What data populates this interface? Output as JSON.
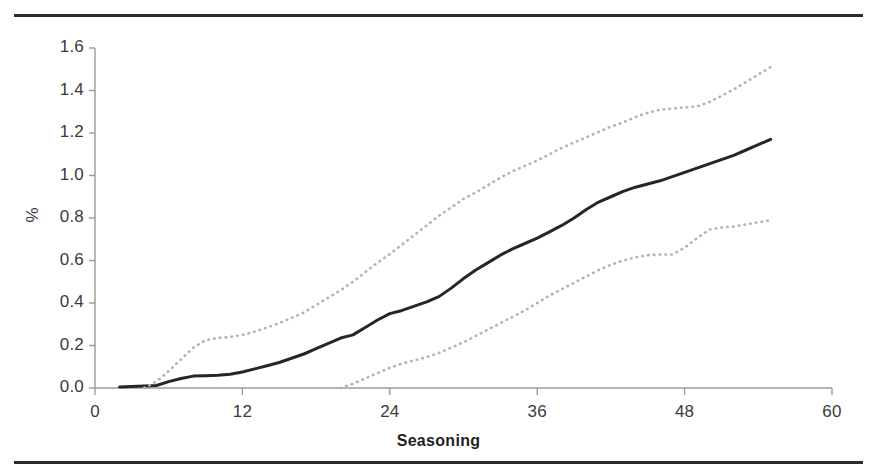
{
  "figure": {
    "background_color": "#ffffff",
    "rule_color": "#2b2b2b",
    "axis_color": "#9a9a9a",
    "solid_series_color": "#262626",
    "dotted_series_color": "#b3b3b3"
  },
  "axes": {
    "y_label": "%",
    "x_label": "Seasoning",
    "y_ticks": [
      "0.0",
      "0.2",
      "0.4",
      "0.6",
      "0.8",
      "1.0",
      "1.2",
      "1.4",
      "1.6"
    ],
    "x_ticks": [
      "0",
      "12",
      "24",
      "36",
      "48",
      "60"
    ]
  },
  "chart_data": {
    "type": "line",
    "title": "",
    "subtitle": "",
    "xlabel": "Seasoning",
    "ylabel": "%",
    "xlim": [
      0,
      60
    ],
    "ylim": [
      0.0,
      1.6
    ],
    "xticks": [
      0,
      12,
      24,
      36,
      48,
      60
    ],
    "yticks": [
      0.0,
      0.2,
      0.4,
      0.6,
      0.8,
      1.0,
      1.2,
      1.4,
      1.6
    ],
    "grid": false,
    "legend": null,
    "legend_position": "none",
    "annotations": [],
    "series": [
      {
        "name": "estimate",
        "style": "solid",
        "color": "#262626",
        "width": 3.0,
        "x": [
          2,
          3,
          4,
          5,
          6,
          7,
          8,
          9,
          10,
          11,
          12,
          13,
          14,
          15,
          16,
          17,
          18,
          19,
          20,
          21,
          22,
          23,
          24,
          25,
          26,
          27,
          28,
          29,
          30,
          31,
          32,
          33,
          34,
          35,
          36,
          37,
          38,
          39,
          40,
          41,
          42,
          43,
          44,
          45,
          46,
          47,
          48,
          49,
          50,
          51,
          52,
          53,
          54,
          55
        ],
        "y": [
          0.005,
          0.007,
          0.01,
          0.012,
          0.03,
          0.045,
          0.056,
          0.058,
          0.06,
          0.065,
          0.075,
          0.09,
          0.105,
          0.12,
          0.14,
          0.16,
          0.185,
          0.21,
          0.235,
          0.25,
          0.285,
          0.32,
          0.35,
          0.365,
          0.385,
          0.405,
          0.43,
          0.47,
          0.515,
          0.555,
          0.59,
          0.625,
          0.655,
          0.68,
          0.705,
          0.735,
          0.765,
          0.8,
          0.84,
          0.875,
          0.9,
          0.925,
          0.945,
          0.96,
          0.975,
          0.995,
          1.015,
          1.035,
          1.055,
          1.075,
          1.095,
          1.12,
          1.145,
          1.17
        ]
      },
      {
        "name": "upper-confidence-limit",
        "style": "dotted",
        "color": "#b3b3b3",
        "width": 2.6,
        "x": [
          4,
          5,
          6,
          7,
          8,
          9,
          10,
          11,
          12,
          13,
          14,
          15,
          16,
          17,
          18,
          19,
          20,
          21,
          22,
          23,
          24,
          25,
          26,
          27,
          28,
          29,
          30,
          31,
          32,
          33,
          34,
          35,
          36,
          37,
          38,
          39,
          40,
          41,
          42,
          43,
          44,
          45,
          46,
          47,
          48,
          49,
          50,
          51,
          52,
          53,
          54,
          55
        ],
        "y": [
          0.0,
          0.03,
          0.08,
          0.135,
          0.19,
          0.225,
          0.235,
          0.24,
          0.25,
          0.265,
          0.285,
          0.305,
          0.33,
          0.355,
          0.39,
          0.425,
          0.46,
          0.5,
          0.545,
          0.59,
          0.63,
          0.675,
          0.72,
          0.765,
          0.81,
          0.85,
          0.89,
          0.92,
          0.955,
          0.99,
          1.02,
          1.045,
          1.07,
          1.1,
          1.13,
          1.155,
          1.18,
          1.205,
          1.23,
          1.25,
          1.275,
          1.295,
          1.31,
          1.315,
          1.32,
          1.325,
          1.345,
          1.375,
          1.405,
          1.44,
          1.475,
          1.51
        ]
      },
      {
        "name": "lower-confidence-limit",
        "style": "dotted",
        "color": "#b3b3b3",
        "width": 2.6,
        "x": [
          20,
          21,
          22,
          23,
          24,
          25,
          26,
          27,
          28,
          29,
          30,
          31,
          32,
          33,
          34,
          35,
          36,
          37,
          38,
          39,
          40,
          41,
          42,
          43,
          44,
          45,
          46,
          47,
          48,
          49,
          50,
          51,
          52,
          53,
          54,
          55
        ],
        "y": [
          0.0,
          0.02,
          0.045,
          0.07,
          0.095,
          0.115,
          0.13,
          0.145,
          0.165,
          0.19,
          0.215,
          0.245,
          0.275,
          0.305,
          0.335,
          0.365,
          0.4,
          0.435,
          0.465,
          0.495,
          0.525,
          0.555,
          0.58,
          0.6,
          0.615,
          0.625,
          0.628,
          0.628,
          0.66,
          0.705,
          0.745,
          0.755,
          0.76,
          0.77,
          0.78,
          0.79
        ]
      }
    ]
  }
}
